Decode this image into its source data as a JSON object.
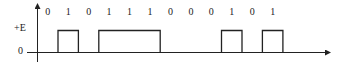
{
  "diagram": {
    "title": "",
    "y_axis_labels": {
      "high": "+E",
      "zero": "0"
    },
    "bits": [
      "0",
      "1",
      "0",
      "1",
      "1",
      "1",
      "0",
      "0",
      "0",
      "1",
      "0",
      "1"
    ],
    "colors": {
      "line": "#222222",
      "background": "#ffffff"
    }
  },
  "chart_data": {
    "type": "line",
    "title": "",
    "xlabel": "",
    "ylabel": "",
    "categories": [
      "b1",
      "b2",
      "b3",
      "b4",
      "b5",
      "b6",
      "b7",
      "b8",
      "b9",
      "b10",
      "b11",
      "b12"
    ],
    "bit_labels": [
      "0",
      "1",
      "0",
      "1",
      "1",
      "1",
      "0",
      "0",
      "0",
      "1",
      "0",
      "1"
    ],
    "series": [
      {
        "name": "signal level",
        "values": [
          0,
          1,
          0,
          1,
          1,
          1,
          0,
          0,
          0,
          1,
          0,
          1
        ]
      }
    ],
    "y_ticks": [
      "0",
      "+E"
    ],
    "ylim": [
      0,
      1
    ],
    "grid": false
  }
}
